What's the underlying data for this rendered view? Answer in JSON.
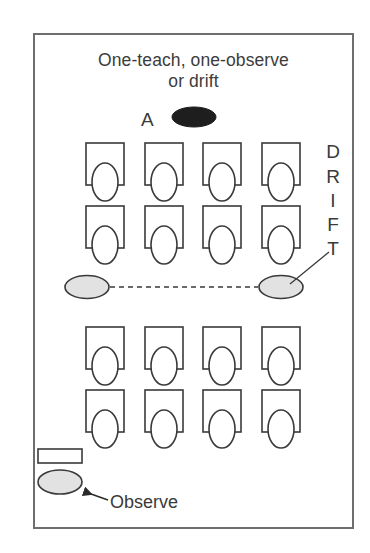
{
  "diagram": {
    "title_line1": "One-teach, one-observe",
    "title_line2": "or drift",
    "teacher_a_label": "A",
    "drift_label_letters": [
      "D",
      "R",
      "I",
      "F",
      "T"
    ],
    "observe_label": "Observe"
  },
  "colors": {
    "frame": "#6e6e6e",
    "stroke": "#3a3a3a",
    "teacher_a_fill": "#1e1e1e",
    "teacher_gray_fill": "#e2e2e2",
    "text": "#3a3a3a"
  },
  "layout": {
    "desk_columns_x": [
      86,
      145,
      203,
      262
    ],
    "desk_rows_y": [
      143,
      206,
      327,
      390
    ],
    "desk_width": 38,
    "desk_height": 42,
    "head_rx": 13,
    "head_ry": 19,
    "drift_letters_y": [
      141,
      166,
      190,
      214,
      238
    ]
  },
  "elements": {
    "teacher_a": {
      "cx": 194,
      "cy": 117,
      "rx": 22,
      "ry": 10
    },
    "teacher_left": {
      "cx": 87,
      "cy": 287,
      "rx": 22,
      "ry": 11.5
    },
    "teacher_right_drift": {
      "cx": 281,
      "cy": 287,
      "rx": 22,
      "ry": 11.5
    },
    "drift_path": {
      "x1": 110,
      "y1": 287,
      "x2": 258,
      "y2": 287
    },
    "drift_leader": {
      "x1": 290,
      "y1": 284,
      "x2": 329,
      "y2": 252
    },
    "observer_desk": {
      "x": 38,
      "y": 449,
      "w": 44,
      "h": 14
    },
    "observer": {
      "cx": 60,
      "cy": 482,
      "rx": 22,
      "ry": 12
    },
    "observe_arrow": {
      "x1": 108,
      "y1": 500,
      "x2": 85,
      "y2": 492
    }
  }
}
